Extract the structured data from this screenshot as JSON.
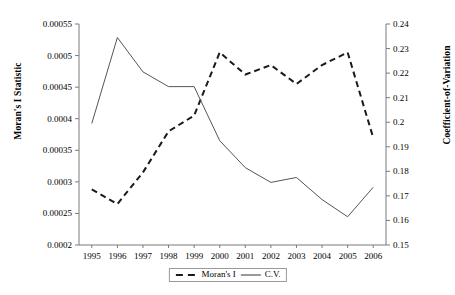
{
  "chart_data": {
    "type": "line",
    "title": "",
    "xlabel": "",
    "categories": [
      "1995",
      "1996",
      "1997",
      "1998",
      "1999",
      "2000",
      "2001",
      "2002",
      "2003",
      "2004",
      "2005",
      "2006"
    ],
    "grid": false,
    "legend_position": "bottom-center",
    "axes": {
      "left": {
        "label": "Moran's I Statistic",
        "ylim": [
          0.0002,
          0.00055
        ],
        "ticks": [
          0.0002,
          0.00025,
          0.0003,
          0.00035,
          0.0004,
          0.00045,
          0.0005,
          0.00055
        ],
        "tick_labels": [
          "0.0002",
          "0.00025",
          "0.0003",
          "0.00035",
          "0.0004",
          "0.00045",
          "0.0005",
          "0.00055"
        ]
      },
      "right": {
        "label": "Coefficient-of-Variation",
        "ylim": [
          0.15,
          0.24
        ],
        "ticks": [
          0.15,
          0.16,
          0.17,
          0.18,
          0.19,
          0.2,
          0.21,
          0.22,
          0.23,
          0.24
        ],
        "tick_labels": [
          "0.15",
          "0.16",
          "0.17",
          "0.18",
          "0.19",
          "0.2",
          "0.21",
          "0.22",
          "0.23",
          "0.24"
        ]
      }
    },
    "series": [
      {
        "name": "Moran's I",
        "axis": "left",
        "style": "dashed",
        "color": "#1a1a1a",
        "values": [
          0.000288,
          0.000265,
          0.000315,
          0.00038,
          0.000405,
          0.000505,
          0.00047,
          0.000485,
          0.000455,
          0.000485,
          0.000505,
          0.00037
        ]
      },
      {
        "name": "C.V.",
        "axis": "right",
        "style": "solid",
        "color": "#555555",
        "values": [
          0.1995,
          0.2345,
          0.2205,
          0.2145,
          0.2145,
          0.1925,
          0.1815,
          0.1755,
          0.1775,
          0.1685,
          0.1615,
          0.1735
        ]
      }
    ]
  },
  "legend": {
    "items": [
      {
        "label": "Moran's I",
        "style": "dashed"
      },
      {
        "label": "C.V.",
        "style": "solid"
      }
    ]
  }
}
